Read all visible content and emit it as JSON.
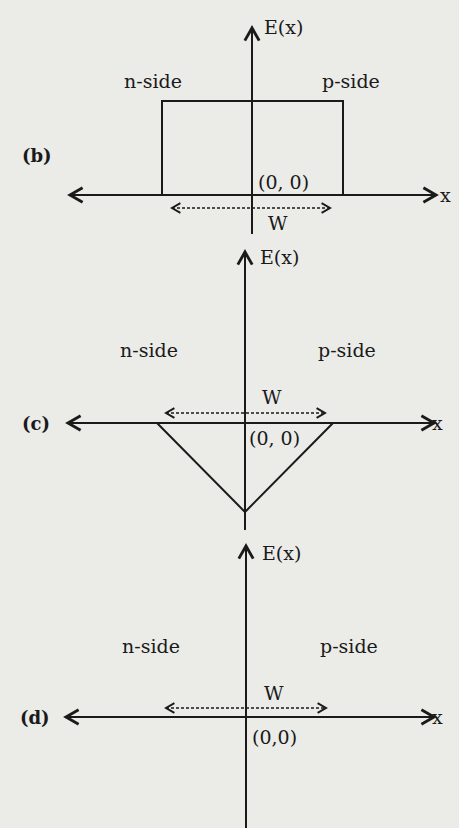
{
  "colors": {
    "background": "#ebebe8",
    "ink": "#1a1a1a"
  },
  "panels": [
    {
      "id": "b",
      "label": "(b)",
      "y_axis_label": "E(x)",
      "x_axis_label": "x",
      "left_region": "n-side",
      "right_region": "p-side",
      "origin_label": "(0, 0)",
      "width_label": "W",
      "shape": "rectangle (constant field across depletion region)"
    },
    {
      "id": "c",
      "label": "(c)",
      "y_axis_label": "E(x)",
      "x_axis_label": "x",
      "left_region": "n-side",
      "right_region": "p-side",
      "origin_label": "(0, 0)",
      "width_label": "W",
      "shape": "inverted triangle (linear field, minimum at origin)"
    },
    {
      "id": "d",
      "label": "(d)",
      "y_axis_label": "E(x)",
      "x_axis_label": "x",
      "left_region": "n-side",
      "right_region": "p-side",
      "origin_label": "(0,0)",
      "width_label": "W",
      "shape": "zero field (axes only)"
    }
  ]
}
